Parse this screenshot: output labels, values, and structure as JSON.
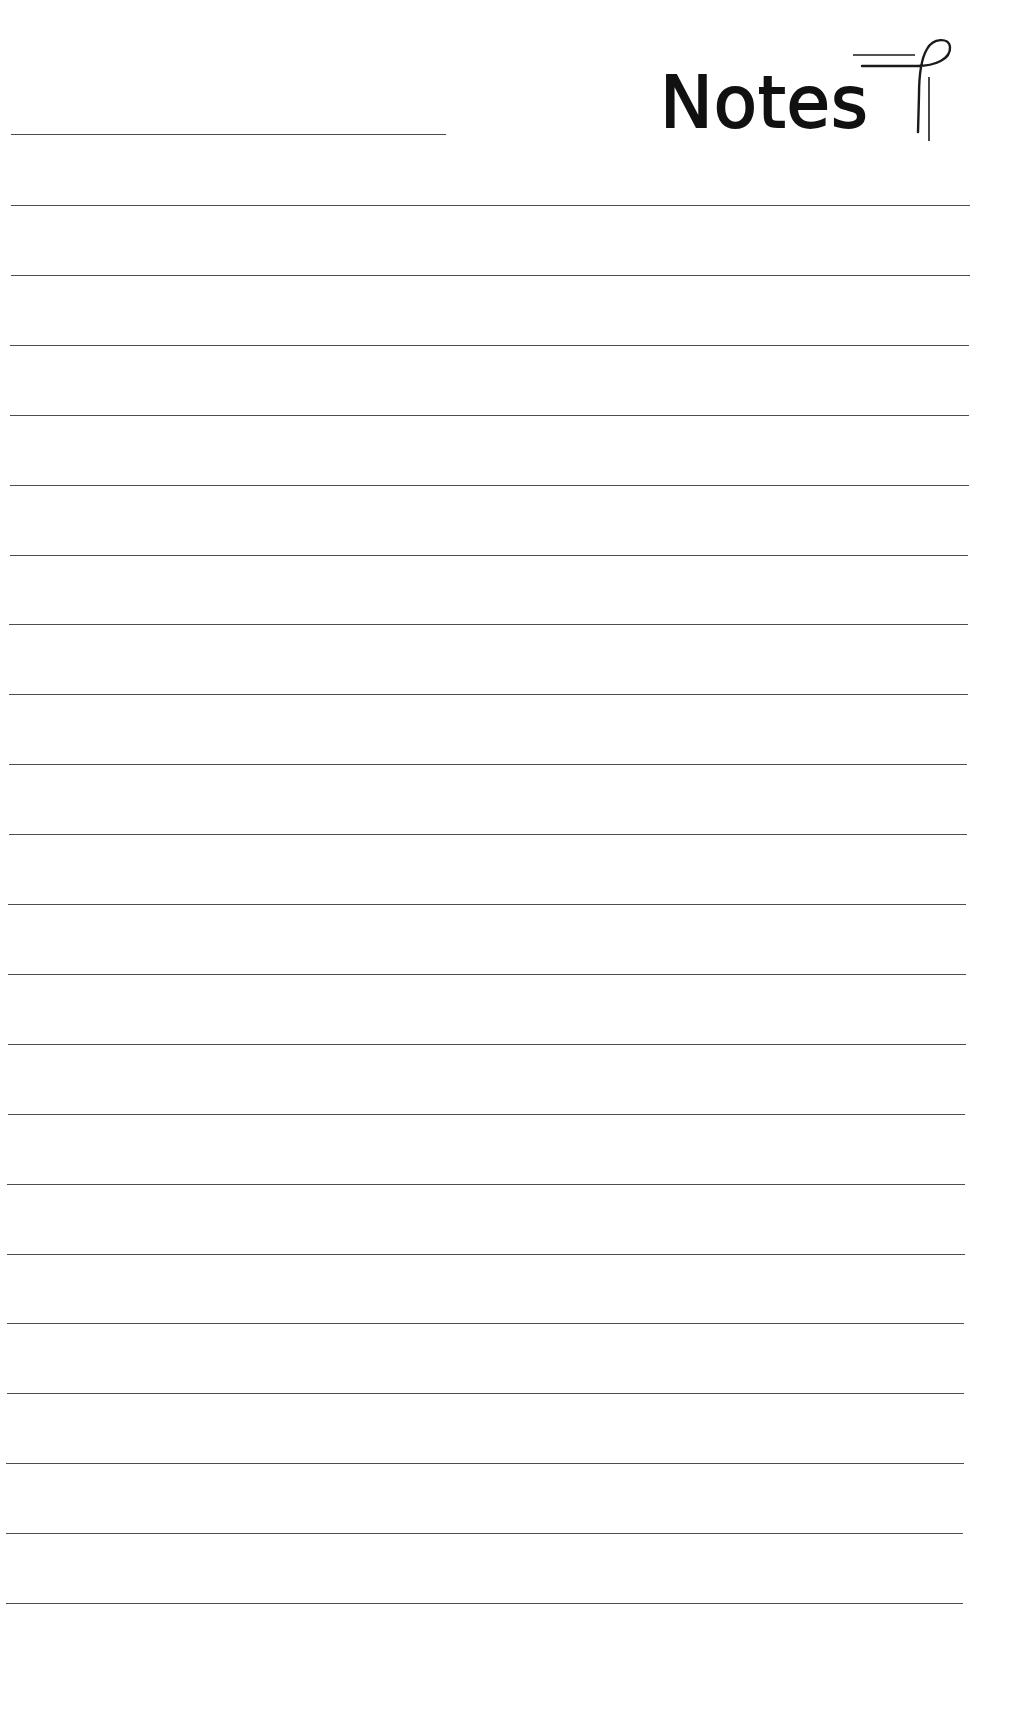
{
  "page": {
    "title": "Notes",
    "title_icon": "pen-flourish-icon",
    "background_color": "#ffffff",
    "line_color": "#4d4d4d",
    "name_line": {
      "value": "",
      "placeholder": ""
    },
    "ruled_lines": {
      "count": 21,
      "first_y": 205,
      "spacing": 69.9,
      "values": [
        "",
        "",
        "",
        "",
        "",
        "",
        "",
        "",
        "",
        "",
        "",
        "",
        "",
        "",
        "",
        "",
        "",
        "",
        "",
        "",
        ""
      ]
    }
  }
}
